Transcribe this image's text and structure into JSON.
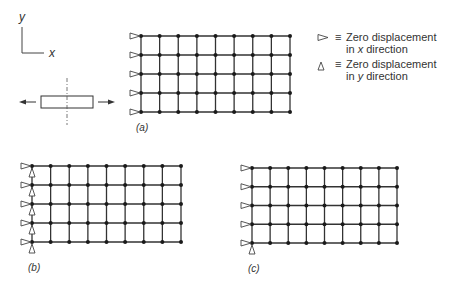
{
  "colors": {
    "line": "#333333",
    "node": "#1a1a1a",
    "support": "#444444",
    "text": "#333333"
  },
  "axes": {
    "x_label": "x",
    "y_label": "y"
  },
  "legend": {
    "x_support": {
      "symbol": "triangle-pointing-right",
      "eq": "≡",
      "line1": "Zero displacement",
      "line2_pre": "in ",
      "line2_var": "x",
      "line2_post": " direction"
    },
    "y_support": {
      "symbol": "triangle-pointing-up",
      "eq": "≡",
      "line1": "Zero displacement",
      "line2_pre": "in ",
      "line2_var": "y",
      "line2_post": " direction"
    }
  },
  "loading_sketch": {
    "description": "bar under tension with vertical symmetry line"
  },
  "meshes": [
    {
      "id": "a",
      "label": "(a)",
      "cols": 9,
      "rows": 5,
      "x0": 141,
      "x1": 290,
      "y0": 36,
      "y1": 112,
      "x_supports": "left-column-all",
      "y_supports": "none",
      "label_pos": [
        136,
        122
      ]
    },
    {
      "id": "b",
      "label": "(b)",
      "cols": 9,
      "rows": 5,
      "x0": 32,
      "x1": 181,
      "y0": 166,
      "y1": 242,
      "x_supports": "left-column-all",
      "y_supports": "left-column-all",
      "label_pos": [
        28,
        262
      ]
    },
    {
      "id": "c",
      "label": "(c)",
      "cols": 9,
      "rows": 5,
      "x0": 252,
      "x1": 397,
      "y0": 168,
      "y1": 243,
      "x_supports": "left-column-all",
      "y_supports": "bottom-left-only",
      "label_pos": [
        248,
        263
      ]
    }
  ]
}
